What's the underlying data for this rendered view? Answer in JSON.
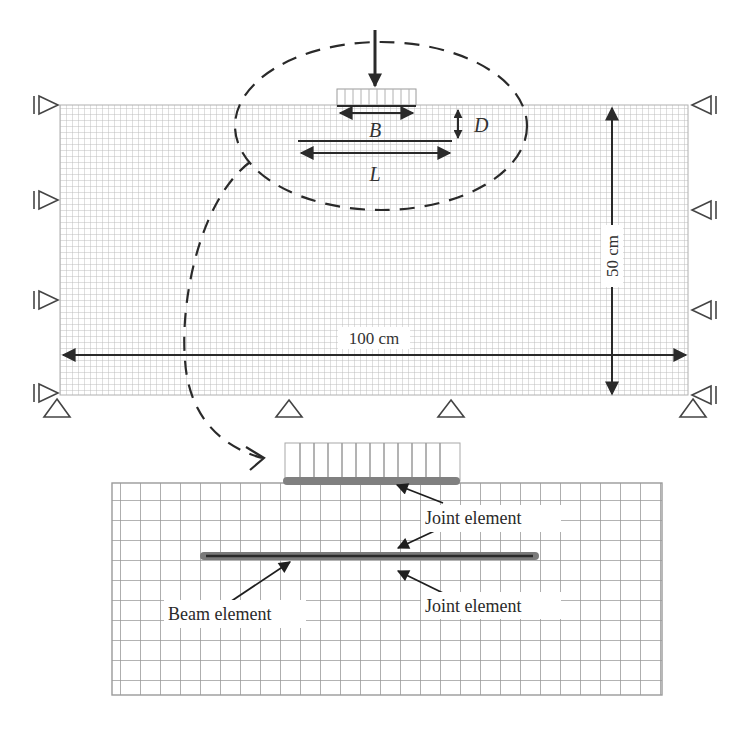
{
  "figure": {
    "top_model": {
      "labels": {
        "footing_width": "B",
        "embedment_depth": "D",
        "reinforcement_length": "L",
        "width_dimension": "100 cm",
        "height_dimension": "50 cm"
      },
      "supports": {
        "left_roller_count": 4,
        "right_roller_count": 4,
        "bottom_pin_count": 4
      }
    },
    "detail_view": {
      "labels": {
        "joint_upper": "Joint element",
        "joint_lower": "Joint element",
        "beam": "Beam element"
      }
    },
    "colors": {
      "mesh_line": "#b8b8b8",
      "mesh_line_dark": "#8a8a8a",
      "ink": "#2a2a2a",
      "beam_gray": "#7a7a7a",
      "footing_gray": "#808080"
    }
  }
}
